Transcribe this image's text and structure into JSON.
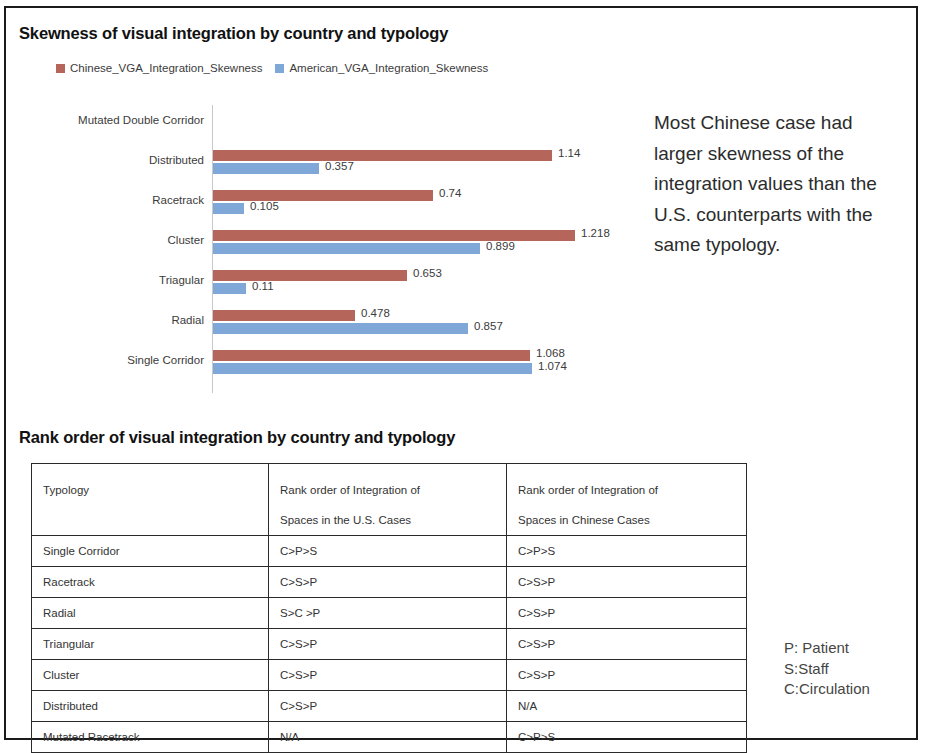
{
  "chart_section": {
    "title": "Skewness of visual integration by country and typology",
    "legend": [
      {
        "label": "Chinese_VGA_Integration_Skewness",
        "color": "#b5655a"
      },
      {
        "label": "American_VGA_Integration_Skewness",
        "color": "#7fa8d8"
      }
    ],
    "callout": "Most Chinese case had larger skewness of the integration values than the U.S. counterparts with the same typology."
  },
  "chart_data": {
    "type": "bar",
    "orientation": "horizontal",
    "title": "Skewness of visual integration by country and typology",
    "xlabel": "",
    "ylabel": "",
    "grid": false,
    "legend_position": "top-left",
    "axis_max": 1.218,
    "categories": [
      "Mutated Double Corridor",
      "Distributed",
      "Racetrack",
      "Cluster",
      "Triagular",
      "Radial",
      "Single Corridor"
    ],
    "series": [
      {
        "name": "Chinese_VGA_Integration_Skewness",
        "color": "#b5655a",
        "values": [
          null,
          1.14,
          0.74,
          1.218,
          0.653,
          0.478,
          1.068
        ],
        "labels": [
          "",
          "1.14",
          "0.74",
          "1.218",
          "0.653",
          "0.478",
          "1.068"
        ]
      },
      {
        "name": "American_VGA_Integration_Skewness",
        "color": "#7fa8d8",
        "values": [
          null,
          0.357,
          0.105,
          0.899,
          0.11,
          0.857,
          1.074
        ],
        "labels": [
          "",
          "0.357",
          "0.105",
          "0.899",
          "0.11",
          "0.857",
          "1.074"
        ]
      }
    ]
  },
  "table_section": {
    "title": "Rank order of visual integration by country and typology",
    "headers": [
      {
        "line1": "Typology",
        "line2": ""
      },
      {
        "line1": "Rank order of Integration of",
        "line2": "Spaces in the U.S. Cases"
      },
      {
        "line1": "Rank order of Integration of",
        "line2": "Spaces in Chinese Cases"
      }
    ],
    "rows": [
      {
        "typology": "Single Corridor",
        "us": "C>P>S",
        "cn": "C>P>S"
      },
      {
        "typology": "Racetrack",
        "us": "C>S>P",
        "cn": "C>S>P"
      },
      {
        "typology": "Radial",
        "us": "S>C >P",
        "cn": "C>S>P"
      },
      {
        "typology": "Triangular",
        "us": "C>S>P",
        "cn": "C>S>P"
      },
      {
        "typology": "Cluster",
        "us": "C>S>P",
        "cn": "C>S>P"
      },
      {
        "typology": "Distributed",
        "us": "C>S>P",
        "cn": "N/A"
      },
      {
        "typology": "Mutated Racetrack",
        "us": "N/A",
        "cn": "C>P>S"
      }
    ]
  },
  "key_legend": {
    "lines": [
      "P: Patient",
      "S:Staff",
      "C:Circulation"
    ]
  }
}
